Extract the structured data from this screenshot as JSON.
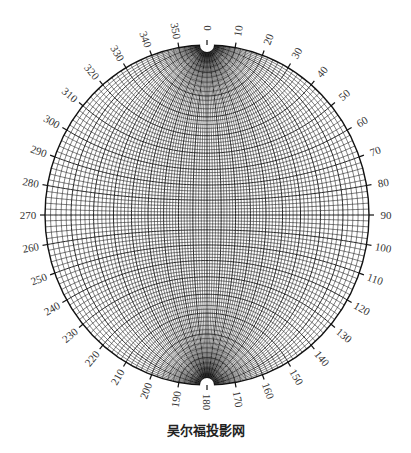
{
  "figure": {
    "title": "吴尔福投影网",
    "type": "Wulff stereographic net",
    "grid_spacing_deg": 2,
    "major_spacing_deg": 10,
    "center": [
      207,
      215
    ],
    "radius_x": 162,
    "radius_y": 170,
    "line_color": "#111111",
    "background": "#ffffff"
  },
  "azimuth_labels": [
    "0",
    "10",
    "20",
    "30",
    "40",
    "50",
    "60",
    "70",
    "80",
    "90",
    "100",
    "110",
    "120",
    "130",
    "140",
    "150",
    "160",
    "170",
    "180",
    "190",
    "200",
    "210",
    "220",
    "230",
    "240",
    "250",
    "260",
    "270",
    "280",
    "290",
    "300",
    "310",
    "320",
    "330",
    "340",
    "350"
  ]
}
